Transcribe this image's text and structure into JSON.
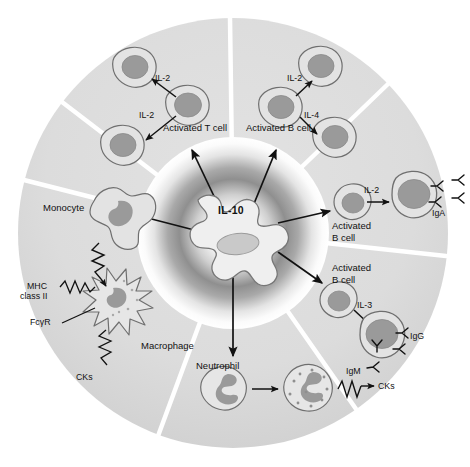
{
  "figure": {
    "type": "cell-signalling-wheel",
    "center_molecule": "IL-10",
    "background_color": "#ffffff",
    "ring_color": "#dcdcdc",
    "ring_divider_color": "#ffffff",
    "cell_body_color": "#e3e3e3",
    "cell_nucleus_color": "#9a9a9a",
    "outline_color": "#6f6f6f",
    "text_color": "#111111",
    "arrow_color": "#111111"
  },
  "center": {
    "label": "IL-10"
  },
  "sectors": [
    {
      "id": "t-cell",
      "target_label": "Activated T cell",
      "cytokines": [
        "IL-2",
        "IL-2"
      ],
      "daughter_cells": 2
    },
    {
      "id": "b-cell-top",
      "target_label": "Activated B cell",
      "cytokines": [
        "IL-2",
        "IL-4"
      ],
      "daughter_cells": 2
    },
    {
      "id": "b-cell-iga",
      "target_label": "Activated\nB cell",
      "cytokines": [
        "IL-2"
      ],
      "antibodies": [
        "IgA"
      ]
    },
    {
      "id": "b-cell-igg-igm",
      "target_label": "Activated\nB cell",
      "cytokines": [
        "IL-3"
      ],
      "antibodies": [
        "IgG",
        "IgM"
      ]
    },
    {
      "id": "neutrophil",
      "target_label": "Neutrophil",
      "products": [
        "CKs"
      ]
    },
    {
      "id": "macrophage",
      "target_label": "Macrophage",
      "markers": [
        "MHC\nclass II",
        "FcγR",
        "CKs"
      ]
    },
    {
      "id": "monocyte",
      "target_label": "Monocyte"
    }
  ],
  "labels": {
    "il10": "IL-10",
    "activated_t_cell": "Activated T cell",
    "activated_b_cell": "Activated B cell",
    "il2_t_upper": "IL-2",
    "il2_t_lower": "IL-2",
    "il2_b_upper": "IL-2",
    "il4_b_lower": "IL-4",
    "monocyte": "Monocyte",
    "macrophage": "Macrophage",
    "mhc_class_ii_line1": "MHC",
    "mhc_class_ii_line2": "class II",
    "fcgr": "FcγR",
    "cks_macrophage": "CKs",
    "neutrophil": "Neutrophil",
    "cks_neutrophil": "CKs",
    "activated_b_cell_iga_line1": "Activated",
    "activated_b_cell_iga_line2": "B cell",
    "il2_iga": "IL-2",
    "iga": "IgA",
    "activated_b_cell_ig_line1": "Activated",
    "activated_b_cell_ig_line2": "B cell",
    "il3": "IL-3",
    "igg": "IgG",
    "igm": "IgM"
  }
}
